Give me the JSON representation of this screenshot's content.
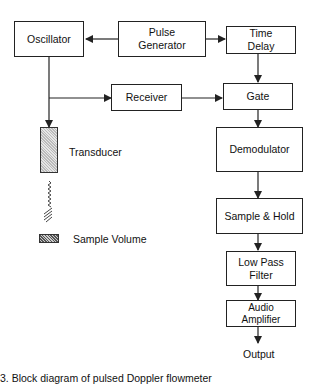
{
  "blocks": {
    "oscillator": "Oscillator",
    "pulse_generator_line1": "Pulse",
    "pulse_generator_line2": "Generator",
    "time_delay_line1": "Time",
    "time_delay_line2": "Delay",
    "receiver": "Receiver",
    "gate": "Gate",
    "demodulator": "Demodulator",
    "sample_hold": "Sample & Hold",
    "low_pass_filter_line1": "Low Pass",
    "low_pass_filter_line2": "Filter",
    "audio_amplifier_line1": "Audio",
    "audio_amplifier_line2": "Amplifier"
  },
  "labels": {
    "transducer": "Transducer",
    "sample_volume": "Sample Volume",
    "output": "Output"
  },
  "caption": "3. Block diagram of pulsed Doppler flowmeter",
  "colors": {
    "line": "#222222",
    "background": "#ffffff"
  }
}
